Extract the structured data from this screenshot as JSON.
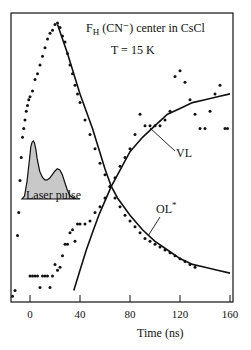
{
  "chart_data": {
    "type": "scatter",
    "title_main": "F",
    "title_sub": "H",
    "title_rest": " (CN⁻) center in CsCl",
    "subtitle": "T = 15 K",
    "xlabel": "Time (ns)",
    "ylabel": "",
    "xlim": [
      -15,
      160
    ],
    "ylim": [
      0,
      1
    ],
    "x_ticks": [
      0,
      40,
      80,
      120,
      160
    ],
    "x_tick_labels": [
      "0",
      "40",
      "80",
      "120",
      "160"
    ],
    "grid": false,
    "legend": null,
    "annotations": [
      {
        "text": "VL",
        "x": 108,
        "y": 0.48,
        "arrow_to": [
          87,
          0.6
        ]
      },
      {
        "text": "OL*",
        "x": 107,
        "y": 0.26,
        "arrow_to": [
          96,
          0.12
        ]
      },
      {
        "text": "Laser pulse",
        "x": 7,
        "y": 0.33,
        "type": "inset-label"
      }
    ],
    "series": [
      {
        "name": "OL* data",
        "kind": "points",
        "x": [
          -14,
          -12,
          -10,
          -9,
          -8,
          -7,
          -6,
          -5,
          -4,
          -3,
          -2,
          -1,
          0,
          2,
          4,
          6,
          8,
          10,
          12,
          14,
          16,
          18,
          20,
          22,
          24,
          26,
          28,
          30,
          32,
          34,
          36,
          38,
          40,
          44,
          48,
          52,
          56,
          60,
          64,
          68,
          72,
          76,
          80,
          84,
          88,
          92,
          96,
          100,
          104,
          108,
          112,
          116,
          120,
          124,
          128,
          132
        ],
        "y": [
          0.02,
          0.04,
          0.23,
          0.31,
          0.42,
          0.5,
          0.57,
          0.6,
          0.63,
          0.66,
          0.68,
          0.7,
          0.71,
          0.73,
          0.77,
          0.79,
          0.82,
          0.85,
          0.88,
          0.91,
          0.93,
          0.94,
          0.96,
          0.965,
          0.95,
          0.92,
          0.9,
          0.86,
          0.82,
          0.79,
          0.75,
          0.72,
          0.69,
          0.63,
          0.58,
          0.53,
          0.48,
          0.44,
          0.4,
          0.36,
          0.33,
          0.3,
          0.28,
          0.26,
          0.24,
          0.22,
          0.21,
          0.2,
          0.19,
          0.18,
          0.17,
          0.16,
          0.15,
          0.14,
          0.13,
          0.12
        ]
      },
      {
        "name": "OL* fit",
        "kind": "line",
        "x": [
          22,
          30,
          40,
          50,
          60,
          65,
          70,
          80,
          90,
          100,
          110,
          120,
          130,
          140,
          150,
          160
        ],
        "y": [
          0.96,
          0.86,
          0.72,
          0.6,
          0.46,
          0.4,
          0.36,
          0.3,
          0.25,
          0.21,
          0.18,
          0.15,
          0.13,
          0.12,
          0.11,
          0.1
        ]
      },
      {
        "name": "VL data",
        "kind": "points",
        "x": [
          0,
          2,
          4,
          6,
          8,
          10,
          12,
          14,
          16,
          18,
          20,
          22,
          24,
          26,
          28,
          30,
          32,
          34,
          36,
          38,
          40,
          44,
          48,
          52,
          56,
          60,
          64,
          68,
          72,
          76,
          80,
          84,
          88,
          92,
          96,
          100,
          104,
          108,
          112,
          116,
          120,
          124,
          128,
          132,
          136,
          140,
          144,
          148,
          152,
          156,
          158
        ],
        "y": [
          0.09,
          0.09,
          0.09,
          0.09,
          0.05,
          0.09,
          0.09,
          0.09,
          0.05,
          0.09,
          0.13,
          0.11,
          0.12,
          0.16,
          0.2,
          0.2,
          0.24,
          0.25,
          0.21,
          0.27,
          0.27,
          0.27,
          0.28,
          0.31,
          0.33,
          0.36,
          0.4,
          0.43,
          0.47,
          0.5,
          0.53,
          0.58,
          0.65,
          0.61,
          0.61,
          0.61,
          0.61,
          0.63,
          0.66,
          0.78,
          0.8,
          0.76,
          0.7,
          0.65,
          0.6,
          0.6,
          0.66,
          0.72,
          0.75,
          0.6,
          0.6
        ]
      },
      {
        "name": "VL fit",
        "kind": "line",
        "x": [
          35,
          40,
          45,
          50,
          55,
          60,
          65,
          70,
          80,
          90,
          100,
          110,
          120,
          130,
          140,
          150,
          160
        ],
        "y": [
          0.04,
          0.11,
          0.18,
          0.24,
          0.3,
          0.35,
          0.4,
          0.44,
          0.52,
          0.57,
          0.61,
          0.65,
          0.67,
          0.69,
          0.7,
          0.71,
          0.72
        ]
      },
      {
        "name": "Laser pulse (inset)",
        "kind": "filled-area",
        "x": [
          -6,
          -4,
          -2,
          0,
          1,
          2,
          3,
          4,
          5,
          6,
          8,
          10,
          12,
          14,
          16,
          18,
          20,
          22,
          24,
          26,
          28,
          30,
          32,
          34,
          36,
          38,
          40
        ],
        "y": [
          0,
          0.05,
          0.3,
          0.7,
          0.9,
          0.98,
          1.0,
          0.96,
          0.85,
          0.7,
          0.48,
          0.38,
          0.33,
          0.33,
          0.36,
          0.42,
          0.48,
          0.52,
          0.5,
          0.42,
          0.28,
          0.15,
          0.06,
          0.03,
          0.01,
          0.0,
          0.0
        ]
      }
    ]
  },
  "colors": {
    "ink": "#111111",
    "pulse_fill": "#c8c8c8",
    "background": "#ffffff"
  }
}
